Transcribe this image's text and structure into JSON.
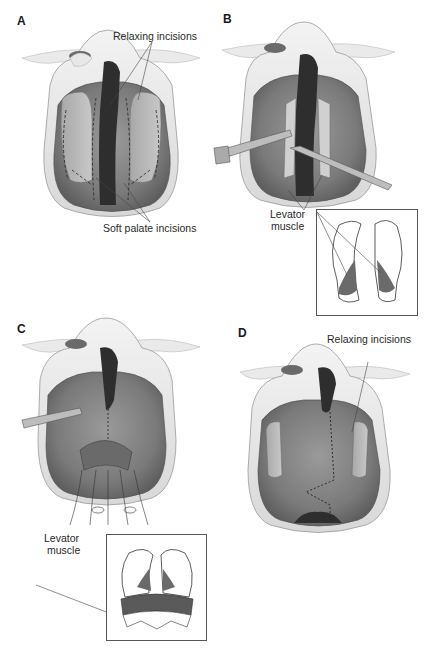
{
  "figure": {
    "panels": [
      {
        "letter": "A",
        "labels": [
          "Relaxing incisions",
          "Soft palate incisions"
        ]
      },
      {
        "letter": "B",
        "labels": [
          "Levator",
          "muscle"
        ],
        "has_inset": true
      },
      {
        "letter": "C",
        "labels": [
          "Levator",
          "muscle"
        ],
        "has_inset": true
      },
      {
        "letter": "D",
        "labels": [
          "Relaxing incisions"
        ]
      }
    ]
  },
  "colors": {
    "skin_light": "#ececec",
    "tissue_mid": "#8a8a8a",
    "tissue_dark": "#5a5a5a",
    "cleft_dark": "#2e2e2e",
    "line": "#333333"
  }
}
